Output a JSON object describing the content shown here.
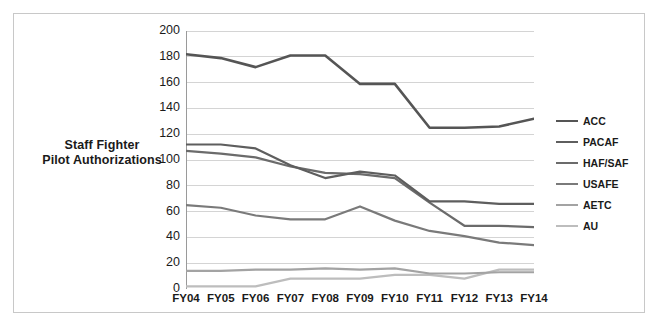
{
  "figure": {
    "background": "#ffffff",
    "frame_color": "#c8c8c8"
  },
  "axis_title": {
    "line1": "Staff Fighter",
    "line2": "Pilot Authorizations"
  },
  "chart_data": {
    "type": "line",
    "title": "",
    "subtitle": "",
    "xlabel": "",
    "ylabel": "Staff Fighter Pilot Authorizations",
    "categories": [
      "FY04",
      "FY05",
      "FY06",
      "FY07",
      "FY08",
      "FY09",
      "FY10",
      "FY11",
      "FY12",
      "FY13",
      "FY14"
    ],
    "x": [
      "FY04",
      "FY05",
      "FY06",
      "FY07",
      "FY08",
      "FY09",
      "FY10",
      "FY11",
      "FY12",
      "FY13",
      "FY14"
    ],
    "ylim": [
      0,
      200
    ],
    "yticks": [
      0,
      20,
      40,
      60,
      80,
      100,
      120,
      140,
      160,
      180,
      200
    ],
    "ytick_labels": [
      "0",
      "20",
      "40",
      "60",
      "80",
      "100",
      "120",
      "140",
      "160",
      "180",
      "200"
    ],
    "grid": "horizontal",
    "grid_color": "#d4d4d4",
    "legend_position": "right",
    "series": [
      {
        "name": "ACC",
        "color": "#555555",
        "width": 2.6,
        "values": [
          182,
          179,
          172,
          181,
          181,
          159,
          159,
          125,
          125,
          126,
          132
        ]
      },
      {
        "name": "PACAF",
        "color": "#5e5e5e",
        "width": 2.2,
        "values": [
          112,
          112,
          109,
          96,
          86,
          91,
          88,
          68,
          68,
          66,
          66
        ]
      },
      {
        "name": "HAF/SAF",
        "color": "#6b6b6b",
        "width": 2.2,
        "values": [
          107,
          105,
          102,
          95,
          90,
          89,
          86,
          67,
          49,
          49,
          48
        ]
      },
      {
        "name": "USAFE",
        "color": "#7a7a7a",
        "width": 2.2,
        "values": [
          65,
          63,
          57,
          54,
          54,
          64,
          53,
          45,
          41,
          36,
          34
        ]
      },
      {
        "name": "AETC",
        "color": "#a3a3a3",
        "width": 2.2,
        "values": [
          14,
          14,
          15,
          15,
          16,
          15,
          16,
          12,
          12,
          13,
          13
        ]
      },
      {
        "name": "AU",
        "color": "#bdbdbd",
        "width": 2.2,
        "values": [
          2,
          2,
          2,
          8,
          8,
          8,
          11,
          11,
          8,
          15,
          15
        ]
      }
    ]
  }
}
